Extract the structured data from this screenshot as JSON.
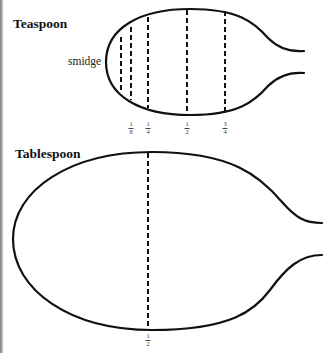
{
  "teaspoon": {
    "title": "Teaspoon",
    "inner_label": "smidge",
    "marks": [
      {
        "num": "1",
        "den": "8",
        "x": 131
      },
      {
        "num": "1",
        "den": "4",
        "x": 148
      },
      {
        "num": "1",
        "den": "2",
        "x": 187
      },
      {
        "num": "3",
        "den": "4",
        "x": 225
      }
    ]
  },
  "tablespoon": {
    "title": "Tablespoon",
    "marks": [
      {
        "num": "1",
        "den": "2",
        "x": 148
      }
    ]
  },
  "colors": {
    "stroke": "#111111",
    "background": "#ffffff"
  }
}
